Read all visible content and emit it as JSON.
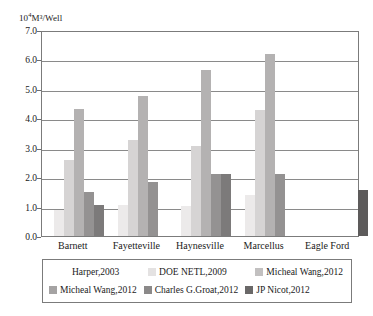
{
  "chart_data": {
    "type": "bar",
    "title": "",
    "subtitle": "",
    "xlabel": "",
    "ylabel": "10⁴M³/Well",
    "ylabel_mantissa": "10",
    "ylabel_exponent": "4",
    "ylabel_rest": "M³/Well",
    "ylim": [
      0.0,
      7.0
    ],
    "ystep": 1.0,
    "grid": true,
    "legend_position": "bottom",
    "categories": [
      "Barnett",
      "Fayetteville",
      "Haynesville",
      "Marcellus",
      "Eagle Ford"
    ],
    "ytick_labels": [
      "7.0",
      "6.0",
      "5.0",
      "4.0",
      "3.0",
      "2.0",
      "1.0",
      "0.0"
    ],
    "ytick_values": [
      7.0,
      6.0,
      5.0,
      4.0,
      3.0,
      2.0,
      1.0,
      0.0
    ],
    "series": [
      {
        "name": "Harper,2003",
        "color": "#eceaea",
        "values": [
          0.88,
          1.07,
          1.02,
          1.38,
          null
        ]
      },
      {
        "name": "DOE NETL,2009",
        "color": "#d6d4d4",
        "values": [
          2.6,
          3.27,
          3.05,
          4.28,
          null
        ]
      },
      {
        "name": "Micheal Wang,2012",
        "color": "#b4b2b2",
        "values": [
          4.3,
          4.75,
          5.65,
          6.2,
          null
        ]
      },
      {
        "name": "Micheal Wang,2012",
        "color": "#949292",
        "values": [
          1.48,
          1.82,
          2.1,
          2.1,
          null
        ]
      },
      {
        "name": "Charles G.Groat,2012",
        "color": "#7c7a7a",
        "values": [
          1.05,
          null,
          2.12,
          null,
          null
        ]
      },
      {
        "name": "JP Nicot,2012",
        "color": "#5d5b5b",
        "values": [
          null,
          null,
          null,
          null,
          1.55
        ]
      }
    ],
    "legend_rows": [
      [
        {
          "name": "Harper,2003",
          "color": "#eceaea",
          "swatch_visible": false
        },
        {
          "name": "DOE NETL,2009",
          "color": "#e4e2e2",
          "swatch_visible": true
        },
        {
          "name": "Micheal Wang,2012",
          "color": "#c2c0c0",
          "swatch_visible": true
        }
      ],
      [
        {
          "name": "Micheal Wang,2012",
          "color": "#a5a3a3",
          "swatch_visible": true
        },
        {
          "name": "Charles G.Groat,2012",
          "color": "#8b8989",
          "swatch_visible": true
        },
        {
          "name": "JP Nicot,2012",
          "color": "#6a6868",
          "swatch_visible": true
        }
      ]
    ]
  }
}
